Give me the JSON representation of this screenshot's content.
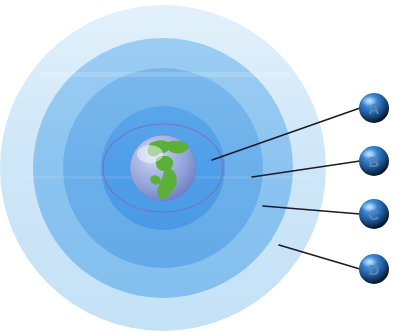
{
  "diagram": {
    "type": "concentric-zone-diagram",
    "center": {
      "x": 163,
      "y": 168
    },
    "globe": {
      "name": "earth-globe",
      "radius": 33,
      "ocean_color": "#8f9fd8",
      "land_color": "#5bb03a",
      "highlight_color": "#cfd8f2",
      "visible_landmass": "Americas"
    },
    "inner_outline": {
      "name": "inner-ellipse-outline",
      "rx": 60,
      "ry": 44,
      "color": "#7b6fc0"
    },
    "zones": [
      {
        "id": "zone-1",
        "label": "A",
        "radius": 62,
        "color": "#4f9ee8",
        "callout_x": 212,
        "callout_y": 160
      },
      {
        "id": "zone-2",
        "label": "B",
        "radius": 100,
        "color": "#6cb0ea",
        "callout_x": 252,
        "callout_y": 177
      },
      {
        "id": "zone-3",
        "label": "C",
        "radius": 130,
        "color": "#8cc4f0",
        "callout_x": 263,
        "callout_y": 206
      },
      {
        "id": "zone-4",
        "label": "D",
        "radius": 163,
        "color": "#cfe7f8",
        "callout_x": 279,
        "callout_y": 245
      }
    ],
    "badges": [
      {
        "id": "badge-a",
        "label": "A",
        "x": 374,
        "y": 108,
        "r": 15
      },
      {
        "id": "badge-b",
        "label": "B",
        "x": 374,
        "y": 161,
        "r": 15
      },
      {
        "id": "badge-c",
        "label": "C",
        "x": 374,
        "y": 214,
        "r": 15
      },
      {
        "id": "badge-d",
        "label": "D",
        "x": 374,
        "y": 269,
        "r": 15
      }
    ],
    "colors": {
      "background": "#ffffff",
      "leader_line": "#1b1b28",
      "badge_dark": "#0a1420",
      "badge_blue": "#2f7fd0",
      "badge_highlight": "#bcdcf8",
      "badge_letter": "#4a6f96"
    }
  }
}
